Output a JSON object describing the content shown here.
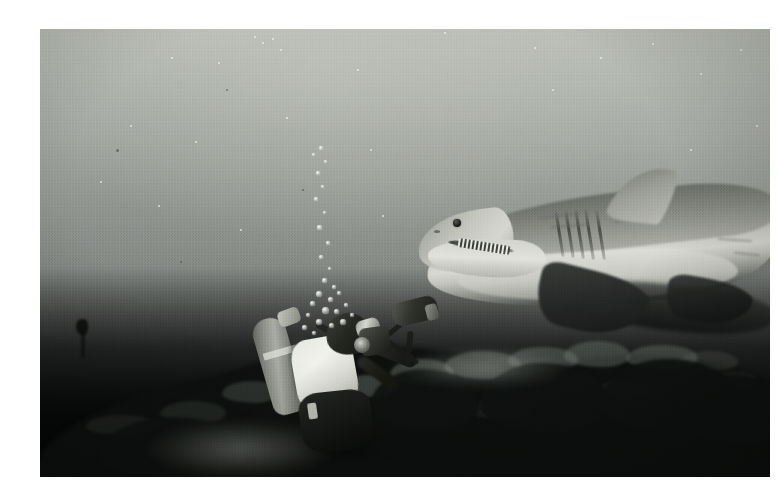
{
  "image": {
    "title": "Great white shark approaching a scuba diver over a kelp reef",
    "medium": "underwater photograph",
    "tone": "monochrome / desaturated blue-grey",
    "frame": {
      "canvas_width_px": 782,
      "canvas_height_px": 503,
      "border_color": "#ffffff",
      "photo_left_px": 40,
      "photo_top_px": 29,
      "photo_width_px": 730,
      "photo_height_px": 448
    },
    "palette": {
      "water_surface_light": "#b9bdb6",
      "water_midwater": "#8d918c",
      "water_deep": "#3c4040",
      "reef_dark": "#060807",
      "shark_dorsal_grey": "#6f736e",
      "shark_belly_white": "#d8d9d2",
      "diver_bcd_white": "#f1f2eb",
      "bubble_white": "#f2f4ee"
    }
  },
  "scene": {
    "caption": "A large great white shark glides in from the right while a scuba diver with an underwater camera rig crouches over a dark kelp-covered reef below.",
    "lighting": "Ambient daylight from above; bright open water at top fading to near-black reef at the bottom.",
    "subjects": [
      {
        "name": "great-white-shark",
        "label": "Great white shark",
        "position": "upper right",
        "facing": "left",
        "parts": [
          "snout",
          "eye",
          "jaw with teeth",
          "gill slits",
          "dorsal fin",
          "pectoral fins",
          "flank scars"
        ]
      },
      {
        "name": "scuba-diver",
        "label": "Scuba diver with camera",
        "position": "lower left of centre",
        "facing": "right",
        "parts": [
          "scuba tank",
          "white BCD vest",
          "black hood",
          "mask",
          "regulator",
          "wetsuit",
          "camera housing",
          "strobe on arm"
        ]
      },
      {
        "name": "kelp-reef",
        "label": "Kelp-covered reef",
        "position": "bottom third",
        "parts": [
          "dense kelp fronds",
          "rock ridge",
          "illuminated sand patch"
        ]
      },
      {
        "name": "bubble-trail",
        "label": "Exhaled bubble trail",
        "position": "rising from diver toward upper centre"
      },
      {
        "name": "distant-silhouette",
        "label": "Small dark silhouette",
        "position": "left midground near reef"
      }
    ]
  },
  "elements": {
    "shark_label": "Great white shark",
    "diver_label": "Scuba diver with underwater camera",
    "reef_label": "Kelp reef bed",
    "bubbles_label": "Rising exhaust bubbles",
    "water_label": "Open water column",
    "particles_label": "Suspended marine particulate",
    "silhouette_label": "Distant dark silhouette",
    "border_label": "White photographic border"
  }
}
